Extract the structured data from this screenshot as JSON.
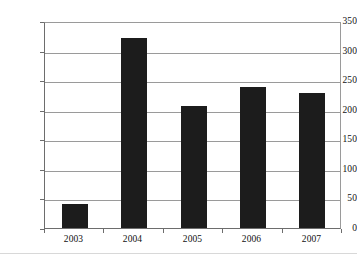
{
  "chart_data": {
    "type": "bar",
    "title": "",
    "subtitle": "",
    "xlabel": "",
    "ylabel": "",
    "categories": [
      "2003",
      "2004",
      "2005",
      "2006",
      "2007"
    ],
    "values": [
      40,
      322,
      207,
      239,
      228
    ],
    "series": [
      {
        "name": "",
        "values": [
          40,
          322,
          207,
          239,
          228
        ]
      }
    ],
    "ylim": [
      0,
      350
    ],
    "ytick_step": 50,
    "ytick_labels": [
      "0",
      "50",
      "100",
      "150",
      "200",
      "250",
      "300",
      "350"
    ],
    "grid": "horizontal",
    "legend": "none",
    "bar_color": "#1c1c1c",
    "gridline_color": "#9a9a9a",
    "axis_color": "#6d6d6d",
    "background_color": "#ffffff",
    "text_color": "#111111"
  }
}
